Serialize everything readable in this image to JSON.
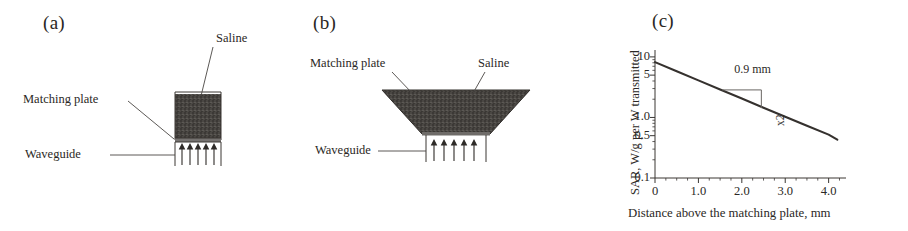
{
  "figure": {
    "panels": [
      {
        "id": "a",
        "label": "(a)",
        "type": "schematic",
        "description": "flat matching plate with rectangular saline bath over waveguide",
        "labels": {
          "saline": "Saline",
          "matching_plate": "Matching plate",
          "waveguide": "Waveguide"
        },
        "arrow_count": 5
      },
      {
        "id": "b",
        "label": "(b)",
        "type": "schematic",
        "description": "flared trapezoidal matching plate with saline over waveguide",
        "labels": {
          "saline": "Saline",
          "matching_plate": "Matching plate",
          "waveguide": "Waveguide"
        },
        "arrow_count": 5
      },
      {
        "id": "c",
        "label": "(c)",
        "type": "chart"
      }
    ]
  },
  "chart_data": {
    "type": "line",
    "title": "",
    "xlabel": "Distance above the matching plate, mm",
    "ylabel": "SAR, W/g per W transmitted",
    "yscale": "log",
    "xlim": [
      0,
      4.4
    ],
    "ylim": [
      0.1,
      13
    ],
    "grid": false,
    "legend": null,
    "xticks": [
      0,
      1.0,
      2.0,
      3.0,
      4.0
    ],
    "xtick_labels": [
      "0",
      "1.0",
      "2.0",
      "3.0",
      "4.0"
    ],
    "yticks": [
      10,
      5,
      1.0,
      0.5,
      0.1
    ],
    "ytick_labels": [
      "10",
      "5",
      "1.0",
      "0.5",
      "0.1"
    ],
    "series": [
      {
        "name": "SAR decay",
        "x": [
          0.0,
          0.5,
          1.0,
          1.5,
          2.0,
          2.5,
          3.0,
          3.5,
          4.0,
          4.2
        ],
        "values": [
          8.2,
          5.8,
          4.1,
          2.9,
          2.05,
          1.45,
          1.03,
          0.73,
          0.52,
          0.43
        ]
      }
    ],
    "annotations": [
      {
        "text": "0.9 mm",
        "role": "halving-distance-run",
        "x": 2.0,
        "y": 3.4
      },
      {
        "text": "x2",
        "role": "halving-factor-rise",
        "x": 2.7,
        "y": 1.9,
        "rotated": true
      }
    ]
  }
}
